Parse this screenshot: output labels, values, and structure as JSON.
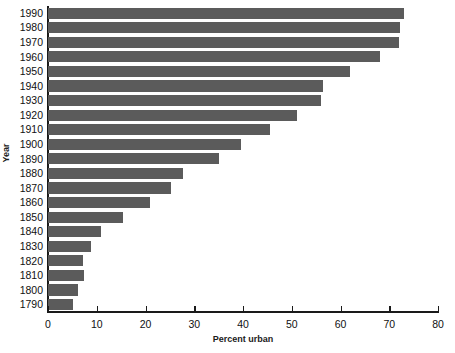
{
  "chart_data": {
    "type": "bar",
    "orientation": "horizontal",
    "title": "",
    "xlabel": "Percent urban",
    "ylabel": "Year",
    "xlim": [
      0,
      80
    ],
    "xticks": [
      0,
      10,
      20,
      30,
      40,
      50,
      60,
      70,
      80
    ],
    "grid": false,
    "legend": null,
    "bar_color": "#5b5b5b",
    "axis_color": "#1a1a1a",
    "background": "#ffffff",
    "categories": [
      "1990",
      "1980",
      "1970",
      "1960",
      "1950",
      "1940",
      "1930",
      "1920",
      "1910",
      "1900",
      "1890",
      "1880",
      "1870",
      "1860",
      "1850",
      "1840",
      "1830",
      "1820",
      "1810",
      "1800",
      "1790"
    ],
    "values": [
      73.0,
      72.3,
      72.1,
      68.1,
      62.0,
      56.5,
      56.1,
      51.0,
      45.6,
      39.5,
      35.1,
      27.6,
      25.2,
      20.9,
      15.4,
      10.8,
      8.8,
      7.2,
      7.3,
      6.1,
      5.1
    ],
    "series": [
      {
        "name": "Percent urban",
        "values": [
          73.0,
          72.3,
          72.1,
          68.1,
          62.0,
          56.5,
          56.1,
          51.0,
          45.6,
          39.5,
          35.1,
          27.6,
          25.2,
          20.9,
          15.4,
          10.8,
          8.8,
          7.2,
          7.3,
          6.1,
          5.1
        ]
      }
    ]
  }
}
